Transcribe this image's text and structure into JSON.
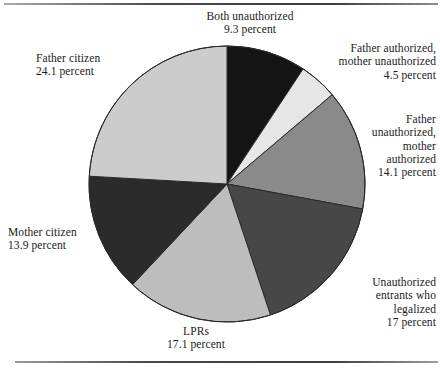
{
  "chart_data": {
    "type": "pie",
    "title": "",
    "subtitle": "",
    "xlabel": "",
    "ylabel": "",
    "legend_position": "none",
    "grid": false,
    "units": "percent",
    "start_angle_deg": 0,
    "direction": "clockwise",
    "total": 100.0,
    "categories": [
      "Both unauthorized",
      "Father authorized, mother unauthorized",
      "Father unauthorized, mother authorized",
      "Unauthorized entrants who legalized",
      "LPRs",
      "Mother citizen",
      "Father citizen"
    ],
    "values": [
      9.3,
      4.5,
      14.1,
      17,
      17.1,
      13.9,
      24.1
    ],
    "slices": [
      {
        "key": "both-unauthorized",
        "label_lines": [
          "Both unauthorized",
          "9.3 percent"
        ],
        "name": "Both unauthorized",
        "value": 9.3,
        "value_text": "9.3 percent",
        "color": "#141414"
      },
      {
        "key": "father-authorized-mother-unauthorized",
        "label_lines": [
          "Father authorized,",
          "mother unauthorized",
          "4.5 percent"
        ],
        "name": "Father authorized, mother unauthorized",
        "value": 4.5,
        "value_text": "4.5 percent",
        "color": "#e6e6e6"
      },
      {
        "key": "father-unauthorized-mother-authorized",
        "label_lines": [
          "Father",
          "unauthorized,",
          "mother",
          "authorized",
          "14.1 percent"
        ],
        "name": "Father unauthorized, mother authorized",
        "value": 14.1,
        "value_text": "14.1 percent",
        "color": "#8a8a8a"
      },
      {
        "key": "unauthorized-entrants-who-legalized",
        "label_lines": [
          "Unauthorized",
          "entrants who",
          "legalized",
          "17 percent"
        ],
        "name": "Unauthorized entrants who legalized",
        "value": 17,
        "value_text": "17 percent",
        "color": "#474747"
      },
      {
        "key": "lprs",
        "label_lines": [
          "LPRs",
          "17.1 percent"
        ],
        "name": "LPRs",
        "value": 17.1,
        "value_text": "17.1 percent",
        "color": "#bdbdbd"
      },
      {
        "key": "mother-citizen",
        "label_lines": [
          "Mother citizen",
          "13.9 percent"
        ],
        "name": "Mother citizen",
        "value": 13.9,
        "value_text": "13.9 percent",
        "color": "#2b2b2b"
      },
      {
        "key": "father-citizen",
        "label_lines": [
          "Father citizen",
          "24.1 percent"
        ],
        "name": "Father citizen",
        "value": 24.1,
        "value_text": "24.1 percent",
        "color": "#cccccc"
      }
    ],
    "geometry": {
      "cx": 227,
      "cy": 184,
      "r": 138,
      "stroke": "#2a2a2a",
      "stroke_width": 1
    },
    "label_positions": [
      {
        "key": "both-unauthorized",
        "x": 250,
        "y": 10,
        "align": "center",
        "anchor": "center"
      },
      {
        "key": "father-authorized-mother-unauthorized",
        "x": 436,
        "y": 42,
        "align": "right",
        "anchor": "right"
      },
      {
        "key": "father-unauthorized-mother-authorized",
        "x": 436,
        "y": 113,
        "align": "right",
        "anchor": "right"
      },
      {
        "key": "unauthorized-entrants-who-legalized",
        "x": 436,
        "y": 276,
        "align": "right",
        "anchor": "right"
      },
      {
        "key": "lprs",
        "x": 196,
        "y": 325,
        "align": "center",
        "anchor": "center"
      },
      {
        "key": "mother-citizen",
        "x": 8,
        "y": 226,
        "align": "left",
        "anchor": "left"
      },
      {
        "key": "father-citizen",
        "x": 36,
        "y": 52,
        "align": "left",
        "anchor": "left"
      }
    ]
  }
}
